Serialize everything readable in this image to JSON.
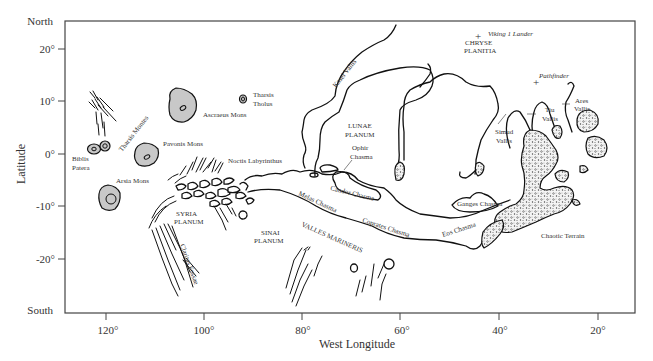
{
  "figure": {
    "type": "map",
    "frame": {
      "left": 65,
      "top": 21,
      "right": 635,
      "bottom": 313
    }
  },
  "axes": {
    "y_title": "Latitude",
    "y_top_label": "North",
    "y_bottom_label": "South",
    "y_ticks": [
      {
        "label": "20°",
        "y": 49
      },
      {
        "label": "10°",
        "y": 101
      },
      {
        "label": "0°",
        "y": 154
      },
      {
        "label": "-10°",
        "y": 206
      },
      {
        "label": "-20°",
        "y": 259
      }
    ],
    "x_title": "West Longitude",
    "x_ticks": [
      {
        "label": "120°",
        "x": 106
      },
      {
        "label": "100°",
        "x": 204
      },
      {
        "label": "80°",
        "x": 302
      },
      {
        "label": "60°",
        "x": 400
      },
      {
        "label": "40°",
        "x": 499
      },
      {
        "label": "20°",
        "x": 598
      }
    ]
  },
  "features": {
    "volcanoes": [
      {
        "name": "Ascraeus Mons"
      },
      {
        "name": "Pavonis Mons"
      },
      {
        "name": "Arsia Mons"
      },
      {
        "name_line1": "Tharsis",
        "name_line2": "Tholus"
      },
      {
        "name_line1": "Biblis",
        "name_line2": "Patera"
      }
    ],
    "tharsis_montes": "Tharsis Montes",
    "noctis": "Noctis Labyrinthus",
    "syria": {
      "line1": "SYRIA",
      "line2": "PLANUM"
    },
    "sinai": {
      "line1": "SINAI",
      "line2": "PLANUM"
    },
    "lunae": {
      "line1": "LUNAE",
      "line2": "PLANUM"
    },
    "chryse": {
      "line1": "CHRYSE",
      "line2": "PLANITIA"
    },
    "claritas": "Claritas Fossae",
    "kasei": "Kasei Vallis",
    "ophir": {
      "line1": "Ophir",
      "line2": "Chasma"
    },
    "candor": "Candor Chasma",
    "melas": "Melas Chasma",
    "coprates": "Coprates Chasma",
    "eos": "Eos Chasma",
    "ganges": "Ganges Chasma",
    "valles_marineris": "VALLES MARINERIS",
    "simud": {
      "line1": "Simud",
      "line2": "Vallis"
    },
    "tiu": {
      "line1": "Tiu",
      "line2": "Vallis"
    },
    "ares": {
      "line1": "Ares",
      "line2": "Vallis"
    },
    "chaotic": "Chaotic Terrain"
  },
  "landing_sites": [
    {
      "name": "Viking 1 Lander",
      "marker": "+"
    },
    {
      "name": "Pathfinder",
      "marker": "+"
    }
  ]
}
